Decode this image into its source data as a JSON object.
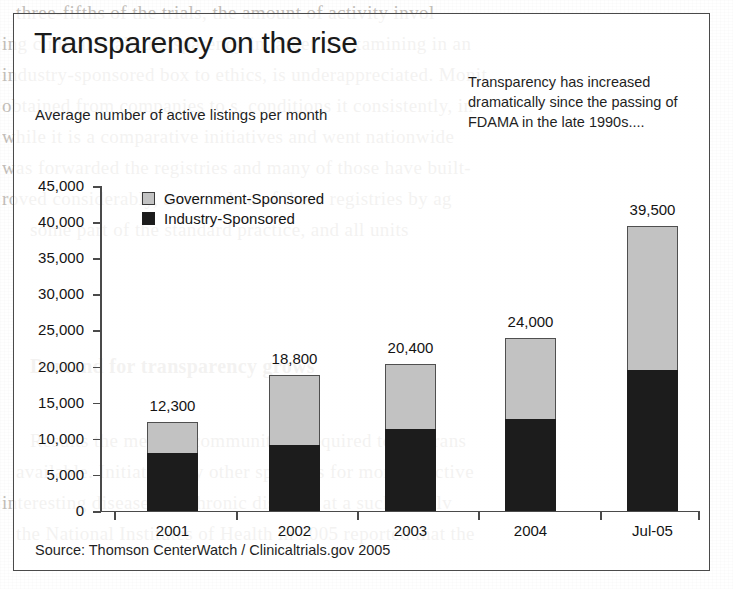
{
  "figure": {
    "title": "Transparency on the rise",
    "subtitle": "Average number of active listings per month",
    "annotation": "Transparency has increased dramatically since the passing of FDAMA in the late 1990s....",
    "source": "Source: Thomson CenterWatch / Clinicaltrials.gov 2005"
  },
  "legend": {
    "items": [
      {
        "label": "Government-Sponsored",
        "color": "#c2c2c2"
      },
      {
        "label": "Industry-Sponsored",
        "color": "#1c1c1c"
      }
    ]
  },
  "chart_data": {
    "type": "bar",
    "subtype": "stacked-vertical",
    "title": "Transparency on the rise",
    "subtitle": "Average number of active listings per month",
    "xlabel": "",
    "ylabel": "Average number of active listings per month",
    "categories": [
      "2001",
      "2002",
      "2003",
      "2004",
      "Jul-05"
    ],
    "series": [
      {
        "name": "Industry-Sponsored",
        "color": "#1c1c1c",
        "values": [
          8000,
          9200,
          11400,
          12800,
          19500
        ]
      },
      {
        "name": "Government-Sponsored",
        "color": "#c2c2c2",
        "values": [
          4300,
          9600,
          9000,
          11200,
          20000
        ]
      }
    ],
    "totals": [
      12300,
      18800,
      20400,
      24000,
      39500
    ],
    "total_labels": [
      "12,300",
      "18,800",
      "20,400",
      "24,000",
      "39,500"
    ],
    "ylim": [
      0,
      45000
    ],
    "ytick_values": [
      0,
      5000,
      10000,
      15000,
      20000,
      25000,
      30000,
      35000,
      40000,
      45000
    ],
    "ytick_labels": [
      "0",
      "5,000",
      "10,000",
      "15,000",
      "20,000",
      "25,000",
      "30,000",
      "35,000",
      "40,000",
      "45,000"
    ],
    "grid": false,
    "legend_position": "upper-left-inside",
    "annotations": [
      "Transparency has increased dramatically since the passing of FDAMA in the late 1990s...."
    ],
    "source": "Source: Thomson CenterWatch / Clinicaltrials.gov 2005"
  },
  "background_text": {
    "heading": "Demand for transparency grows",
    "lines": [
      "three-fifths of the  trials, the amount of activity invol",
      "ing clinical trials transparency in target re-examining  in an",
      "industry-sponsored box to ethics, is underappreciated. Monit",
      "obtained from companies to  s, conditions it consistently, in",
      "while it is a comparative initiatives  and went  nationwide",
      "was forwarded  the registries and  many of those  have  built-",
      "roved considerably,  as new data  of these  registries   by ag",
      "some part of the standard practice, and all units",
      "Results the medical community is required to  the trans",
      "available. Initiatives by other sponsors for  more  effective",
      "interesting  diseases  on chronic  diseases  at a  such  to  solv",
      "the National Institutes of Health in 2005 reported that the"
    ]
  }
}
